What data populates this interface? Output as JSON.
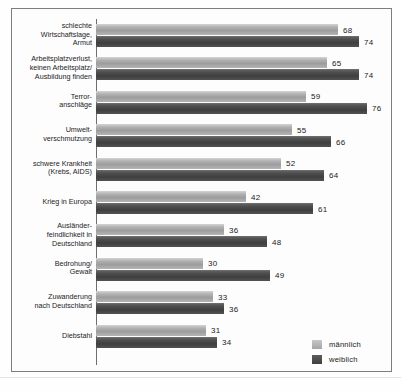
{
  "chart_data": {
    "type": "bar",
    "orientation": "horizontal",
    "title": "",
    "xlabel": "",
    "ylabel": "",
    "xlim": [
      0,
      80
    ],
    "grid": false,
    "legend_position": "bottom-right",
    "categories": [
      "schlechte\nWirtschaftslage,\nArmut",
      "Arbeitsplatzverlust,\nkeinen Arbeitsplatz/\nAusbildung finden",
      "Terror-\nanschläge",
      "Umwelt-\nverschmutzung",
      "schwere Krankheit\n(Krebs, AIDS)",
      "Krieg in Europa",
      "Ausländer-\nfeindlichkeit in\nDeutschland",
      "Bedrohung/\nGewalt",
      "Zuwanderung\nnach Deutschland",
      "Diebstahl"
    ],
    "series": [
      {
        "name": "männlich",
        "color": "#a8a8a8",
        "values": [
          68,
          65,
          59,
          55,
          52,
          42,
          36,
          30,
          33,
          31
        ]
      },
      {
        "name": "weiblich",
        "color": "#474747",
        "values": [
          74,
          74,
          76,
          66,
          64,
          61,
          48,
          49,
          36,
          34
        ]
      }
    ]
  },
  "legend": {
    "items": [
      {
        "label": "männlich"
      },
      {
        "label": "weiblich"
      }
    ]
  },
  "caption": {
    "text": ""
  }
}
